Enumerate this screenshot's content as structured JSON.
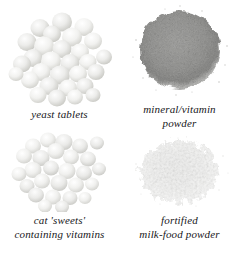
{
  "figure": {
    "background_color": "#ffffff",
    "layout": "2x2-grid",
    "caption_color": "#17171a",
    "panels": [
      {
        "id": "yeast-tablets",
        "position": "top-left",
        "specimen_type": "tablet-cluster",
        "specimen_color": "#e8e8e6",
        "specimen_shade_color": "#c6c6c2",
        "caption_lines": [
          "yeast  tablets"
        ]
      },
      {
        "id": "mineral-vitamin-powder",
        "position": "top-right",
        "specimen_type": "granular-powder-mound",
        "specimen_color": "#9b9b99",
        "specimen_shade_color": "#7d7d7b",
        "caption_lines": [
          "mineral/vitamin",
          "powder"
        ]
      },
      {
        "id": "cat-sweets",
        "position": "bottom-left",
        "specimen_type": "tablet-cluster",
        "specimen_color": "#ececeb",
        "specimen_shade_color": "#cfcfcc",
        "caption_lines": [
          "cat 'sweets'",
          "containing vitamins"
        ]
      },
      {
        "id": "fortified-milk-food-powder",
        "position": "bottom-right",
        "specimen_type": "flaky-powder-heap",
        "specimen_color": "#f4f4f3",
        "specimen_shade_color": "#d8d8d6",
        "caption_lines": [
          "fortified",
          "milk-food powder"
        ]
      }
    ]
  }
}
